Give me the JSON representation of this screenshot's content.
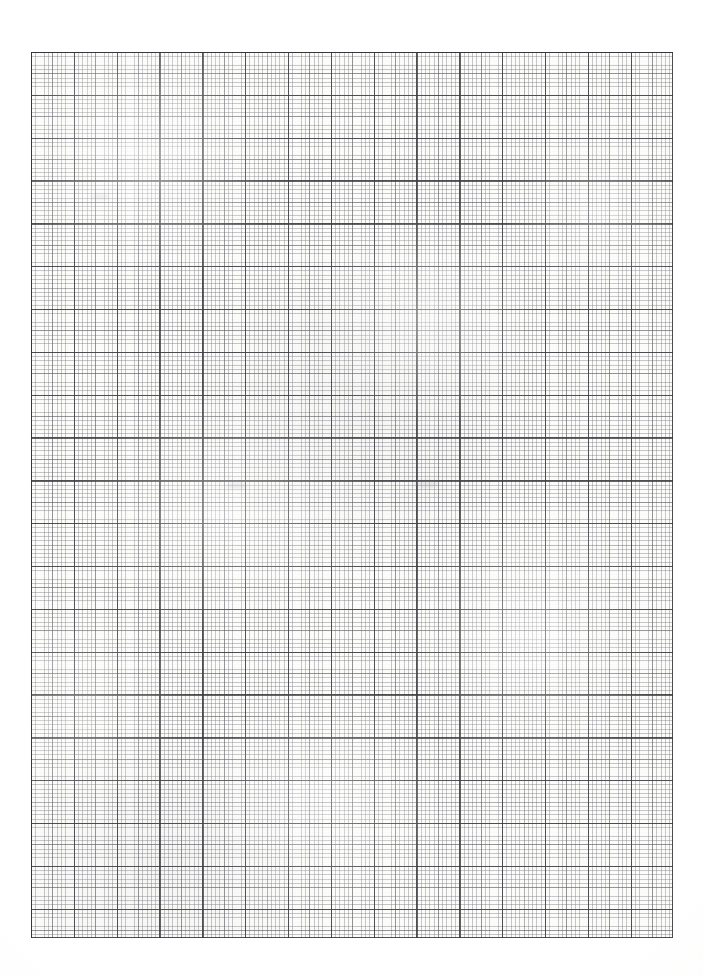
{
  "document": {
    "kind": "graph-paper-scan",
    "title": "Blank graph paper sheet",
    "description": "Scanned sheet of blank cross-section graph paper with no handwriting, plotted data, labels or annotations.",
    "visible_text": "",
    "page_width_px": 703,
    "page_height_px": 975
  },
  "colors": {
    "page_background": "#ffffff",
    "grid_field": "#fdfdfc",
    "minor_line": "#6e6e73",
    "mid_line": "#58585c",
    "major_line": "#3c3c40",
    "border_line": "#343438"
  },
  "grid": {
    "left_px": 31,
    "top_px": 52,
    "width_px": 642,
    "height_px": 886,
    "minor_spacing_px": 4.2833,
    "mid_spacing_px": 21.4166,
    "major_spacing_px": 42.8333,
    "minor_per_mid": 5,
    "minor_per_major": 10,
    "major_columns": 15,
    "major_rows": 20,
    "border": "heavy rule on all four sides"
  },
  "margins": {
    "top_label": "top margin",
    "left_label": "left margin",
    "right_label": "right margin",
    "bottom_label": "bottom margin",
    "content": ""
  }
}
